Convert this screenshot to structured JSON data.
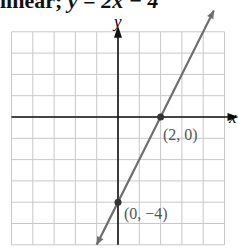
{
  "caption": {
    "prefix": "linear; ",
    "equation": "y = 2x − 4"
  },
  "chart_data": {
    "type": "line",
    "title": "",
    "xlabel": "x",
    "ylabel": "y",
    "xlim": [
      -5,
      5
    ],
    "ylim": [
      -6,
      4
    ],
    "grid": true,
    "series": [
      {
        "name": "y = 2x − 4",
        "equation": "y = 2x - 4",
        "x": [
          -1,
          4.5
        ],
        "y": [
          -6,
          5
        ]
      }
    ],
    "points": [
      {
        "x": 2,
        "y": 0,
        "label": "(2, 0)"
      },
      {
        "x": 0,
        "y": -4,
        "label": "(0, −4)"
      }
    ]
  },
  "colors": {
    "grid": "#c8c8c8",
    "axis": "#111111",
    "line": "#6e6e6e"
  }
}
